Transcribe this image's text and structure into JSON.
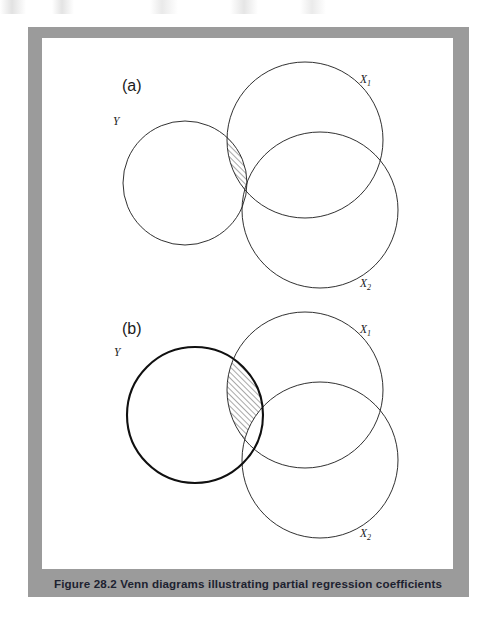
{
  "page": {
    "background_color": "#ffffff",
    "width": 500,
    "height": 620
  },
  "figure": {
    "frame_color": "#9b9b9b",
    "canvas_color": "#ffffff",
    "caption": {
      "number": "Figure 28.2",
      "title": "Venn diagrams illustrating partial regression coefficients",
      "full_text": "Figure 28.2  Venn diagrams illustrating partial regression coefficients",
      "text_color": "#1d2230"
    },
    "panels": [
      {
        "id": "a",
        "label": "(a)",
        "sets": [
          {
            "name": "Y",
            "label": "Y",
            "sub": "",
            "emphasis": "normal"
          },
          {
            "name": "X1",
            "label": "X",
            "sub": "1",
            "emphasis": "normal"
          },
          {
            "name": "X2",
            "label": "X",
            "sub": "2",
            "emphasis": "normal"
          }
        ],
        "shaded_region": "Y ∩ X1 excluding X2",
        "shading_style": "diagonal hatch"
      },
      {
        "id": "b",
        "label": "(b)",
        "sets": [
          {
            "name": "Y",
            "label": "Y",
            "sub": "",
            "emphasis": "bold"
          },
          {
            "name": "X1",
            "label": "X",
            "sub": "1",
            "emphasis": "normal"
          },
          {
            "name": "X2",
            "label": "X",
            "sub": "2",
            "emphasis": "normal"
          }
        ],
        "shaded_region": "Y ∩ X1 excluding X2",
        "shading_style": "diagonal hatch"
      }
    ]
  },
  "chart_data": {
    "type": "diagram",
    "diagram_type": "venn",
    "title": "Venn diagrams illustrating partial regression coefficients",
    "panels": [
      {
        "panel": "(a)",
        "circles": [
          {
            "set": "Y",
            "cx": 143,
            "cy": 145,
            "r": 62,
            "stroke_width": 0.9
          },
          {
            "set": "X1",
            "cx": 263,
            "cy": 102,
            "r": 78,
            "stroke_width": 0.9
          },
          {
            "set": "X2",
            "cx": 278,
            "cy": 172,
            "r": 78,
            "stroke_width": 0.9
          }
        ],
        "hatched": {
          "expression": "Y ∩ X1 \\ X2",
          "angle_deg": 45,
          "spacing_px": 4
        }
      },
      {
        "panel": "(b)",
        "circles": [
          {
            "set": "Y",
            "cx": 153,
            "cy": 377,
            "r": 68,
            "stroke_width": 2.1
          },
          {
            "set": "X1",
            "cx": 263,
            "cy": 352,
            "r": 78,
            "stroke_width": 0.9
          },
          {
            "set": "X2",
            "cx": 278,
            "cy": 422,
            "r": 78,
            "stroke_width": 0.9
          }
        ],
        "hatched": {
          "expression": "Y ∩ X1 \\ X2",
          "angle_deg": 45,
          "spacing_px": 4
        }
      }
    ],
    "legend": [
      "Y",
      "X1",
      "X2"
    ],
    "grid": false
  }
}
